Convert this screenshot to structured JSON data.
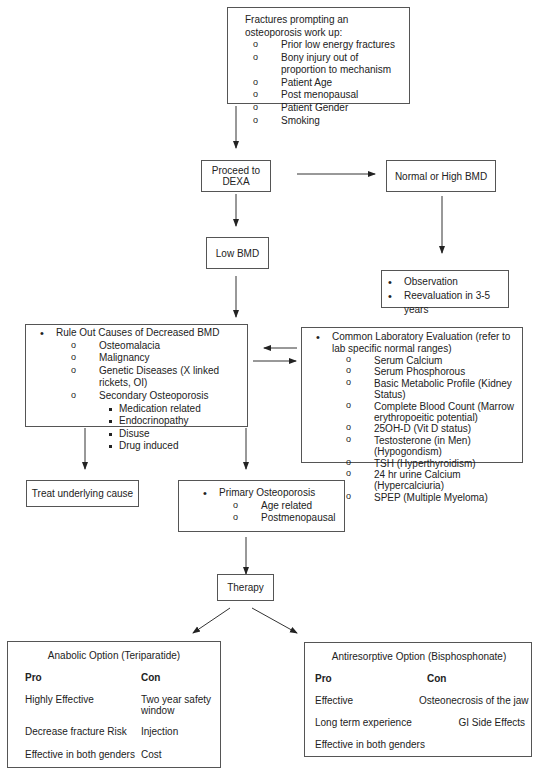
{
  "fractures_box": {
    "title": "Fractures prompting an osteoporosis work up:",
    "items": [
      "Prior low energy fractures",
      "Bony injury out of proportion to mechanism",
      "Patient Age",
      "Post menopausal",
      "Patient Gender",
      "Smoking"
    ]
  },
  "dexa_box": {
    "label": "Proceed to DEXA"
  },
  "normal_bmd_box": {
    "label": "Normal or High BMD"
  },
  "low_bmd_box": {
    "label": "Low BMD"
  },
  "observation_box": {
    "items": [
      "Observation",
      "Reevaluation in 3-5 years"
    ]
  },
  "rule_out_box": {
    "title": "Rule Out Causes of Decreased BMD",
    "items": [
      "Osteomalacia",
      "Malignancy",
      "Genetic Diseases (X linked rickets, OI)",
      "Secondary Osteoporosis"
    ],
    "secondary_items": [
      "Medication related",
      "Endocrinopathy",
      "Disuse",
      "Drug induced"
    ]
  },
  "lab_box": {
    "title": "Common Laboratory Evaluation (refer to lab specific normal ranges)",
    "items": [
      "Serum Calcium",
      "Serum Phosphorous",
      "Basic Metabolic Profile (Kidney Status)",
      "Complete Blood Count (Marrow erythropoeitic potential)",
      "25OH-D (Vit D status)",
      "Testosterone (in Men) (Hypogondism)",
      "TSH (Hyperthyroidism)",
      "24 hr urine Calcium (Hypercalciuria)",
      "SPEP (Multiple Myeloma)"
    ]
  },
  "treat_box": {
    "label": "Treat underlying cause"
  },
  "primary_box": {
    "title": "Primary Osteoporosis",
    "items": [
      "Age related",
      "Postmenopausal"
    ]
  },
  "therapy_box": {
    "label": "Therapy"
  },
  "anabolic_box": {
    "title": "Anabolic Option (Teriparatide)",
    "pro_header": "Pro",
    "con_header": "Con",
    "rows": [
      {
        "pro": "Highly Effective",
        "con": "Two year safety window"
      },
      {
        "pro": "Decrease fracture Risk",
        "con": "Injection"
      },
      {
        "pro": "Effective in both genders",
        "con": "Cost"
      }
    ]
  },
  "antiresorptive_box": {
    "title": "Antiresorptive Option (Bisphosphonate)",
    "pro_header": "Pro",
    "con_header": "Con",
    "rows": [
      {
        "pro": "Effective",
        "con": "Osteonecrosis of the jaw"
      },
      {
        "pro": "Long term experience",
        "con": "GI Side Effects"
      },
      {
        "pro": "Effective in both genders",
        "con": ""
      }
    ]
  }
}
